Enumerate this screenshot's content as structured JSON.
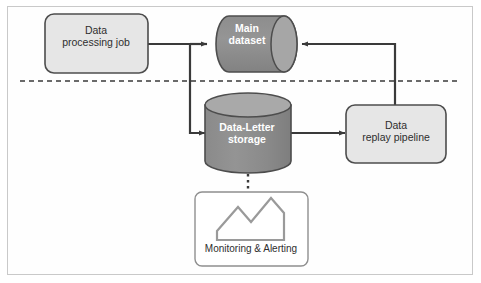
{
  "figure": {
    "background": "#ffffff",
    "frame_border_color": "#c9c9c9"
  },
  "palette": {
    "box_fill": "#e6e6e6",
    "box_stroke": "#4d4d4d",
    "cylinder_fill": "#8c8c8c",
    "cylinder_cap_fill": "#a6a6a6",
    "cylinder_stroke": "#4d4d4d",
    "arrow_color": "#3a3a3a",
    "divider_color": "#3a3a3a",
    "icon_stroke": "#9a9a9a",
    "plain_box_stroke": "#8f8f8f",
    "dark_text": "#2e2e2e",
    "light_text": "#ffffff"
  },
  "nodes": {
    "processing_job": {
      "label_line1": "Data",
      "label_line2": "processing job",
      "shape": "rounded-rectangle",
      "fill": "#e6e6e6"
    },
    "main_dataset": {
      "label_line1": "Main",
      "label_line2": "dataset",
      "shape": "horizontal-cylinder",
      "fill": "#8c8c8c"
    },
    "dead_letter_storage": {
      "label_line1": "Data-Letter",
      "label_line2": "storage",
      "shape": "vertical-cylinder",
      "fill": "#8c8c8c"
    },
    "replay_pipeline": {
      "label_line1": "Data",
      "label_line2": "replay pipeline",
      "shape": "rounded-rectangle",
      "fill": "#e6e6e6"
    },
    "monitoring": {
      "label": "Monitoring & Alerting",
      "shape": "rounded-rectangle",
      "icon": "mountain-chart-icon",
      "fill": "#ffffff"
    }
  },
  "connectors": [
    {
      "name": "job-to-main-dataset",
      "from": "processing_job",
      "to": "main_dataset",
      "style": "solid-arrow"
    },
    {
      "name": "job-to-dead-letter-storage",
      "from": "processing_job",
      "to": "dead_letter_storage",
      "style": "solid-arrow"
    },
    {
      "name": "dead-letter-storage-to-replay-pipeline",
      "from": "dead_letter_storage",
      "to": "replay_pipeline",
      "style": "solid-arrow"
    },
    {
      "name": "replay-pipeline-to-main-dataset",
      "from": "replay_pipeline",
      "to": "main_dataset",
      "style": "solid-arrow"
    },
    {
      "name": "dead-letter-storage-to-monitoring",
      "from": "dead_letter_storage",
      "to": "monitoring",
      "style": "dotted-line"
    }
  ],
  "divider": {
    "name": "horizontal-dashed-divider",
    "style": "dashed"
  }
}
